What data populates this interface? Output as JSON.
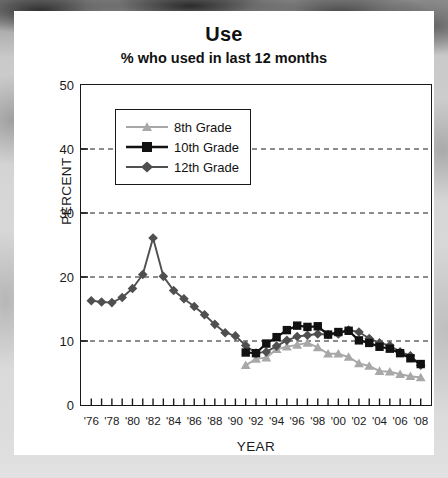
{
  "chart_data": {
    "type": "line",
    "title": "Use",
    "subtitle": "% who used in last 12 months",
    "xlabel": "YEAR",
    "ylabel": "PERCENT",
    "ylim": [
      0,
      50
    ],
    "yticks": [
      0,
      10,
      20,
      30,
      40,
      50
    ],
    "xlim": [
      1975,
      2009
    ],
    "xtick_labels": [
      "'76",
      "'78",
      "'80",
      "'82",
      "'84",
      "'86",
      "'88",
      "'90",
      "'92",
      "'94",
      "'96",
      "'98",
      "'00",
      "'02",
      "'04",
      "'06",
      "'08"
    ],
    "xtick_years": [
      1976,
      1978,
      1980,
      1982,
      1984,
      1986,
      1988,
      1990,
      1992,
      1994,
      1996,
      1998,
      2000,
      2002,
      2004,
      2006,
      2008
    ],
    "grid": "horizontal-dashed",
    "legend_position": "upper-left-inside",
    "series": [
      {
        "name": "8th Grade",
        "color": "#a8a8a8",
        "marker": "triangle",
        "x": [
          1991,
          1992,
          1993,
          1994,
          1995,
          1996,
          1997,
          1998,
          1999,
          2000,
          2001,
          2002,
          2003,
          2004,
          2005,
          2006,
          2007,
          2008
        ],
        "values": [
          6.2,
          7.2,
          7.4,
          8.7,
          9.1,
          9.4,
          9.7,
          9.0,
          8.0,
          8.0,
          7.5,
          6.5,
          6.1,
          5.3,
          5.2,
          4.8,
          4.5,
          4.3
        ]
      },
      {
        "name": "10th Grade",
        "color": "#111111",
        "marker": "square",
        "x": [
          1991,
          1992,
          1993,
          1994,
          1995,
          1996,
          1997,
          1998,
          1999,
          2000,
          2001,
          2002,
          2003,
          2004,
          2005,
          2006,
          2007,
          2008
        ],
        "values": [
          8.2,
          8.1,
          9.6,
          10.6,
          11.7,
          12.4,
          12.2,
          12.3,
          11.0,
          11.4,
          11.6,
          10.1,
          9.7,
          9.1,
          8.8,
          8.1,
          7.3,
          6.4
        ]
      },
      {
        "name": "12th Grade",
        "color": "#4f4f4f",
        "marker": "diamond",
        "x": [
          1976,
          1977,
          1978,
          1979,
          1980,
          1981,
          1982,
          1983,
          1984,
          1985,
          1986,
          1987,
          1988,
          1989,
          1990,
          1991,
          1992,
          1993,
          1994,
          1995,
          1996,
          1997,
          1998,
          1999,
          2000,
          2001,
          2002,
          2003,
          2004,
          2005,
          2006,
          2007,
          2008
        ],
        "values": [
          16.3,
          16.1,
          16.0,
          16.8,
          18.2,
          20.4,
          26.1,
          20.1,
          17.9,
          16.6,
          15.4,
          14.1,
          12.6,
          11.3,
          10.8,
          9.3,
          8.1,
          8.3,
          9.2,
          10.1,
          10.7,
          10.9,
          11.1,
          11.0,
          11.1,
          11.7,
          11.4,
          10.4,
          9.7,
          9.3,
          8.3,
          7.7,
          6.2
        ]
      }
    ]
  }
}
